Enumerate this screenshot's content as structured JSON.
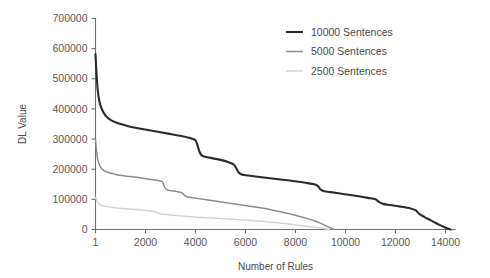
{
  "chart_data": {
    "type": "line",
    "title": "",
    "xlabel": "Number of Rules",
    "ylabel": "DL Value",
    "xlim": [
      1,
      14400
    ],
    "ylim": [
      0,
      700000
    ],
    "grid": false,
    "legend_position": "top-right",
    "xticks": [
      1,
      2000,
      4000,
      6000,
      8000,
      10000,
      12000,
      14000
    ],
    "xticklabels": [
      "1",
      "2000",
      "4000",
      "6000",
      "8000",
      "10000",
      "12000",
      "14000"
    ],
    "yticks": [
      0,
      100000,
      200000,
      300000,
      400000,
      500000,
      600000,
      700000
    ],
    "yticklabels": [
      "0",
      "100000",
      "200000",
      "300000",
      "400000",
      "500000",
      "600000",
      "700000"
    ],
    "series": [
      {
        "name": "10000 Sentences",
        "color": "#2b2b2b",
        "width": 2.1,
        "points": [
          [
            1,
            582000
          ],
          [
            40,
            520000
          ],
          [
            90,
            462000
          ],
          [
            150,
            428000
          ],
          [
            230,
            404000
          ],
          [
            330,
            387000
          ],
          [
            450,
            374000
          ],
          [
            600,
            364000
          ],
          [
            800,
            356000
          ],
          [
            1050,
            349000
          ],
          [
            1350,
            342000
          ],
          [
            1700,
            336000
          ],
          [
            2100,
            330000
          ],
          [
            2500,
            324000
          ],
          [
            2900,
            318000
          ],
          [
            3300,
            312000
          ],
          [
            3650,
            306000
          ],
          [
            3900,
            300000
          ],
          [
            4000,
            296000
          ],
          [
            4080,
            280000
          ],
          [
            4160,
            258000
          ],
          [
            4250,
            246000
          ],
          [
            4400,
            241000
          ],
          [
            4700,
            236000
          ],
          [
            5000,
            231000
          ],
          [
            5300,
            224000
          ],
          [
            5520,
            216000
          ],
          [
            5620,
            205000
          ],
          [
            5720,
            190000
          ],
          [
            5820,
            183000
          ],
          [
            6000,
            180000
          ],
          [
            6400,
            176000
          ],
          [
            6900,
            171000
          ],
          [
            7400,
            166000
          ],
          [
            7900,
            161000
          ],
          [
            8400,
            155000
          ],
          [
            8750,
            150000
          ],
          [
            8900,
            144000
          ],
          [
            9000,
            133000
          ],
          [
            9150,
            127000
          ],
          [
            9400,
            124000
          ],
          [
            9900,
            118000
          ],
          [
            10400,
            112000
          ],
          [
            10900,
            105000
          ],
          [
            11200,
            100000
          ],
          [
            11330,
            92000
          ],
          [
            11500,
            85000
          ],
          [
            11800,
            81000
          ],
          [
            12200,
            76000
          ],
          [
            12600,
            70000
          ],
          [
            12800,
            64000
          ],
          [
            12950,
            52000
          ],
          [
            13150,
            42000
          ],
          [
            13400,
            31000
          ],
          [
            13650,
            20000
          ],
          [
            13900,
            10000
          ],
          [
            14050,
            4000
          ],
          [
            14150,
            1500
          ],
          [
            14200,
            0
          ]
        ]
      },
      {
        "name": "5000 Sentences",
        "color": "#8c8c8c",
        "width": 1.5,
        "points": [
          [
            1,
            298000
          ],
          [
            35,
            268000
          ],
          [
            80,
            238000
          ],
          [
            140,
            218000
          ],
          [
            210,
            206000
          ],
          [
            300,
            198000
          ],
          [
            420,
            192000
          ],
          [
            560,
            188000
          ],
          [
            750,
            184000
          ],
          [
            980,
            180000
          ],
          [
            1250,
            177000
          ],
          [
            1550,
            174000
          ],
          [
            1900,
            170000
          ],
          [
            2250,
            166000
          ],
          [
            2550,
            162000
          ],
          [
            2680,
            158000
          ],
          [
            2760,
            141000
          ],
          [
            2850,
            132000
          ],
          [
            3000,
            129000
          ],
          [
            3250,
            126000
          ],
          [
            3450,
            122000
          ],
          [
            3560,
            114000
          ],
          [
            3680,
            108000
          ],
          [
            3900,
            105000
          ],
          [
            4250,
            101000
          ],
          [
            4650,
            96000
          ],
          [
            5050,
            91000
          ],
          [
            5450,
            86000
          ],
          [
            5850,
            81000
          ],
          [
            6250,
            76000
          ],
          [
            6650,
            71000
          ],
          [
            7050,
            65000
          ],
          [
            7400,
            59000
          ],
          [
            7750,
            52000
          ],
          [
            8100,
            45000
          ],
          [
            8450,
            37000
          ],
          [
            8750,
            29000
          ],
          [
            9000,
            21000
          ],
          [
            9200,
            13000
          ],
          [
            9380,
            6000
          ],
          [
            9480,
            2000
          ],
          [
            9530,
            0
          ]
        ]
      },
      {
        "name": "2500 Sentences",
        "color": "#d2d2d2",
        "width": 1.4,
        "points": [
          [
            1,
            107000
          ],
          [
            40,
            98000
          ],
          [
            90,
            90000
          ],
          [
            160,
            84000
          ],
          [
            250,
            80000
          ],
          [
            380,
            77000
          ],
          [
            520,
            75000
          ],
          [
            700,
            73000
          ],
          [
            920,
            71000
          ],
          [
            1180,
            69000
          ],
          [
            1480,
            67000
          ],
          [
            1800,
            65000
          ],
          [
            2100,
            62000
          ],
          [
            2350,
            59000
          ],
          [
            2500,
            56000
          ],
          [
            2620,
            52000
          ],
          [
            2780,
            50000
          ],
          [
            3000,
            48000
          ],
          [
            3300,
            46000
          ],
          [
            3600,
            44000
          ],
          [
            3900,
            42000
          ],
          [
            4250,
            40000
          ],
          [
            4650,
            38000
          ],
          [
            5050,
            36000
          ],
          [
            5450,
            34000
          ],
          [
            5850,
            32000
          ],
          [
            6250,
            30000
          ],
          [
            6650,
            27000
          ],
          [
            7050,
            24000
          ],
          [
            7400,
            21000
          ],
          [
            7750,
            18000
          ],
          [
            8100,
            14000
          ],
          [
            8450,
            11000
          ],
          [
            8750,
            8000
          ],
          [
            9000,
            5000
          ],
          [
            9180,
            2500
          ],
          [
            9300,
            800
          ],
          [
            9360,
            0
          ]
        ]
      }
    ]
  },
  "legend": {
    "entries": [
      {
        "label": "10000 Sentences"
      },
      {
        "label": "5000 Sentences"
      },
      {
        "label": "2500 Sentences"
      }
    ]
  }
}
